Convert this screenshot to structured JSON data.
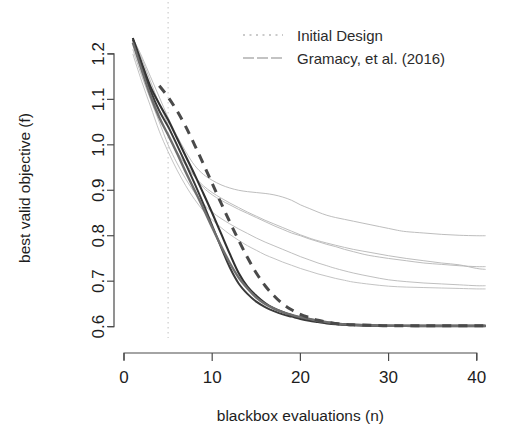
{
  "chart_data": {
    "type": "line",
    "title": "",
    "xlabel": "blackbox evaluations (n)",
    "ylabel": "best valid objective (f)",
    "xlim": [
      0,
      41.5
    ],
    "ylim": [
      0.575,
      1.235
    ],
    "xticks": [
      0,
      10,
      20,
      30,
      40
    ],
    "xtick_labels": [
      "0",
      "10",
      "20",
      "30",
      "40"
    ],
    "yticks": [
      0.6,
      0.7,
      0.8,
      0.9,
      1.0,
      1.1,
      1.2
    ],
    "ytick_labels": [
      "0.6",
      "0.7",
      "0.8",
      "0.9",
      "1.0",
      "1.1",
      "1.2"
    ],
    "grid": false,
    "legend_position": "top-right",
    "legend": [
      {
        "label": "Initial Design",
        "style": "dotted",
        "color": "#b9b9b9"
      },
      {
        "label": "Gramacy, et al. (2016)",
        "style": "solid",
        "color": "#b0b0b0"
      }
    ],
    "annotations": [
      {
        "name": "initial-design-line",
        "type": "vline",
        "x": 5,
        "style": "dotted",
        "color": "#c8c8c8"
      }
    ],
    "series": [
      {
        "name": "gramacy-run-1",
        "group": "Gramacy, et al. (2016)",
        "color": "#b5b5b5",
        "style": "solid",
        "width": 0.9,
        "x": [
          1,
          2,
          3,
          4,
          5,
          6,
          7,
          8,
          9,
          10,
          11,
          12,
          13,
          14,
          15,
          16,
          17,
          18,
          19,
          20,
          21,
          22,
          23,
          24,
          25,
          26,
          27,
          28,
          29,
          30,
          31,
          32,
          34,
          36,
          38,
          40,
          41
        ],
        "y": [
          1.235,
          1.195,
          1.15,
          1.105,
          1.06,
          1.02,
          0.985,
          0.955,
          0.935,
          0.922,
          0.912,
          0.905,
          0.9,
          0.897,
          0.895,
          0.893,
          0.89,
          0.885,
          0.878,
          0.868,
          0.86,
          0.852,
          0.845,
          0.84,
          0.836,
          0.832,
          0.828,
          0.824,
          0.82,
          0.816,
          0.812,
          0.809,
          0.806,
          0.803,
          0.801,
          0.8,
          0.8
        ]
      },
      {
        "name": "gramacy-run-2",
        "group": "Gramacy, et al. (2016)",
        "color": "#b5b5b5",
        "style": "solid",
        "width": 0.9,
        "x": [
          1,
          2,
          3,
          4,
          5,
          6,
          7,
          8,
          9,
          10,
          11,
          12,
          13,
          14,
          15,
          16,
          17,
          18,
          19,
          20,
          21,
          22,
          23,
          24,
          25,
          26,
          27,
          28,
          30,
          32,
          34,
          36,
          38,
          40,
          41
        ],
        "y": [
          1.235,
          1.19,
          1.14,
          1.09,
          1.045,
          1.0,
          0.962,
          0.93,
          0.906,
          0.89,
          0.878,
          0.868,
          0.858,
          0.849,
          0.84,
          0.831,
          0.822,
          0.814,
          0.806,
          0.8,
          0.793,
          0.787,
          0.781,
          0.776,
          0.77,
          0.765,
          0.76,
          0.756,
          0.75,
          0.745,
          0.74,
          0.737,
          0.734,
          0.732,
          0.732
        ]
      },
      {
        "name": "gramacy-run-3",
        "group": "Gramacy, et al. (2016)",
        "color": "#b5b5b5",
        "style": "solid",
        "width": 0.9,
        "x": [
          1,
          2,
          3,
          4,
          5,
          6,
          7,
          8,
          9,
          10,
          11,
          12,
          13,
          14,
          15,
          16,
          17,
          18,
          19,
          20,
          21,
          22,
          24,
          26,
          28,
          30,
          32,
          34,
          36,
          38,
          40,
          41
        ],
        "y": [
          1.225,
          1.168,
          1.115,
          1.065,
          1.02,
          0.985,
          0.955,
          0.93,
          0.91,
          0.895,
          0.883,
          0.872,
          0.862,
          0.852,
          0.843,
          0.834,
          0.826,
          0.818,
          0.81,
          0.802,
          0.795,
          0.789,
          0.779,
          0.77,
          0.763,
          0.756,
          0.75,
          0.745,
          0.74,
          0.736,
          0.728,
          0.726
        ]
      },
      {
        "name": "gramacy-run-4",
        "group": "Gramacy, et al. (2016)",
        "color": "#b8b8b8",
        "style": "solid",
        "width": 0.9,
        "x": [
          1,
          2,
          3,
          4,
          5,
          6,
          7,
          8,
          9,
          10,
          11,
          12,
          13,
          14,
          15,
          16,
          17,
          18,
          19,
          20,
          21,
          22,
          23,
          24,
          26,
          28,
          30,
          32,
          34,
          36,
          38,
          40,
          41
        ],
        "y": [
          1.21,
          1.152,
          1.1,
          1.05,
          1.0,
          0.96,
          0.925,
          0.895,
          0.87,
          0.852,
          0.838,
          0.826,
          0.815,
          0.805,
          0.795,
          0.786,
          0.778,
          0.77,
          0.762,
          0.754,
          0.747,
          0.74,
          0.734,
          0.728,
          0.718,
          0.71,
          0.703,
          0.699,
          0.696,
          0.694,
          0.692,
          0.69,
          0.69
        ]
      },
      {
        "name": "gramacy-run-5",
        "group": "Gramacy, et al. (2016)",
        "color": "#bcbcbc",
        "style": "solid",
        "width": 0.9,
        "x": [
          1,
          2,
          3,
          4,
          5,
          6,
          7,
          8,
          9,
          10,
          11,
          12,
          13,
          14,
          15,
          16,
          17,
          18,
          19,
          20,
          21,
          22,
          23,
          24,
          25,
          26,
          28,
          30,
          32,
          34,
          36,
          38,
          40,
          41
        ],
        "y": [
          1.2,
          1.14,
          1.085,
          1.03,
          0.985,
          0.945,
          0.91,
          0.88,
          0.855,
          0.835,
          0.818,
          0.803,
          0.79,
          0.778,
          0.768,
          0.758,
          0.75,
          0.742,
          0.735,
          0.728,
          0.722,
          0.716,
          0.711,
          0.706,
          0.702,
          0.698,
          0.693,
          0.689,
          0.687,
          0.686,
          0.685,
          0.684,
          0.683,
          0.683
        ]
      },
      {
        "name": "proposed-run-dark-1",
        "group": "proposed",
        "color": "#303030",
        "style": "solid",
        "width": 2.1,
        "x": [
          1,
          2,
          3,
          4,
          5,
          6,
          7,
          8,
          9,
          10,
          11,
          12,
          13,
          14,
          15,
          16,
          17,
          18,
          19,
          20,
          21,
          22,
          23,
          24,
          25,
          26,
          28,
          30,
          33,
          36,
          40,
          41
        ],
        "y": [
          1.235,
          1.18,
          1.128,
          1.09,
          1.055,
          1.015,
          0.975,
          0.935,
          0.893,
          0.85,
          0.805,
          0.76,
          0.718,
          0.688,
          0.668,
          0.652,
          0.64,
          0.632,
          0.625,
          0.62,
          0.616,
          0.612,
          0.609,
          0.607,
          0.605,
          0.604,
          0.603,
          0.602,
          0.602,
          0.602,
          0.602,
          0.602
        ]
      },
      {
        "name": "proposed-run-dark-2",
        "group": "proposed",
        "color": "#3a3a3a",
        "style": "solid",
        "width": 2.0,
        "x": [
          1,
          2,
          3,
          4,
          5,
          6,
          7,
          8,
          9,
          10,
          11,
          12,
          13,
          14,
          15,
          16,
          17,
          18,
          19,
          20,
          21,
          22,
          23,
          24,
          25,
          26,
          28,
          30,
          33,
          36,
          40,
          41
        ],
        "y": [
          1.232,
          1.175,
          1.12,
          1.075,
          1.04,
          1.0,
          0.958,
          0.915,
          0.87,
          0.822,
          0.775,
          0.73,
          0.695,
          0.672,
          0.655,
          0.643,
          0.634,
          0.627,
          0.622,
          0.617,
          0.613,
          0.61,
          0.607,
          0.605,
          0.604,
          0.603,
          0.602,
          0.602,
          0.601,
          0.601,
          0.601,
          0.601
        ]
      },
      {
        "name": "proposed-run-gray",
        "group": "proposed",
        "color": "#6e6e6e",
        "style": "solid",
        "width": 2.4,
        "x": [
          1,
          2,
          3,
          4,
          5,
          6,
          7,
          8,
          9,
          10,
          11,
          12,
          13,
          14,
          15,
          16,
          17,
          18,
          19,
          20,
          21,
          22,
          23,
          24,
          25,
          26,
          28,
          30,
          33,
          36,
          40,
          41
        ],
        "y": [
          1.225,
          1.165,
          1.108,
          1.06,
          1.022,
          0.982,
          0.94,
          0.9,
          0.86,
          0.818,
          0.778,
          0.74,
          0.708,
          0.684,
          0.664,
          0.65,
          0.64,
          0.632,
          0.626,
          0.621,
          0.617,
          0.613,
          0.61,
          0.607,
          0.605,
          0.604,
          0.603,
          0.602,
          0.602,
          0.602,
          0.602,
          0.602
        ]
      },
      {
        "name": "proposed-run-dashed",
        "group": "proposed",
        "color": "#4a4a4a",
        "style": "dashed",
        "width": 3.0,
        "x": [
          4,
          5,
          6,
          7,
          8,
          9,
          10,
          11,
          12,
          13,
          14,
          15,
          16,
          17,
          18,
          19,
          20,
          21,
          22,
          23,
          24,
          25,
          26,
          28,
          30,
          33,
          36,
          40,
          41
        ],
        "y": [
          1.13,
          1.105,
          1.075,
          1.04,
          1.0,
          0.958,
          0.915,
          0.872,
          0.83,
          0.79,
          0.752,
          0.718,
          0.69,
          0.668,
          0.65,
          0.637,
          0.627,
          0.62,
          0.614,
          0.61,
          0.607,
          0.605,
          0.604,
          0.603,
          0.602,
          0.602,
          0.602,
          0.602,
          0.602
        ]
      }
    ]
  }
}
